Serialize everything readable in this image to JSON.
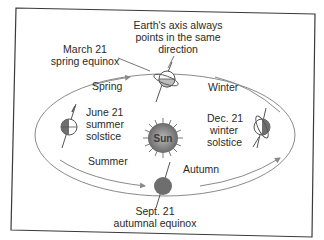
{
  "diagram": {
    "title_note": [
      "Earth's axis always",
      "points in the same",
      "direction"
    ],
    "center": {
      "label": "Sun"
    },
    "seasons": {
      "spring": "Spring",
      "winter": "Winter",
      "summer": "Summer",
      "autumn": "Autumn"
    },
    "positions": [
      {
        "id": "march",
        "lines": [
          "March 21",
          "spring equinox"
        ]
      },
      {
        "id": "june",
        "lines": [
          "June 21",
          "summer",
          "solstice"
        ]
      },
      {
        "id": "sept",
        "lines": [
          "Sept. 21",
          "autumnal equinox"
        ]
      },
      {
        "id": "dec",
        "lines": [
          "Dec. 21",
          "winter",
          "solstice"
        ]
      }
    ],
    "colors": {
      "ink": "#2a2a2a",
      "earth_dark": "#6e6e6e",
      "sun": "#8a8a8a",
      "orbit": "#8a8a8a",
      "frame": "#3a3a3a"
    }
  }
}
